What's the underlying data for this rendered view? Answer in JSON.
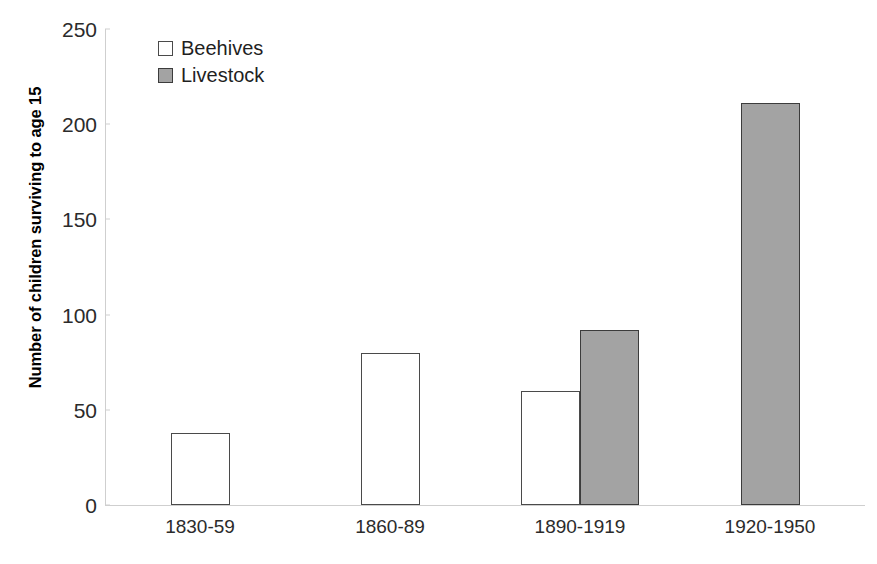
{
  "chart_data": {
    "type": "bar",
    "title": "",
    "subtitle": "",
    "xlabel": "",
    "ylabel": "Number of children surviving to age 15",
    "categories": [
      "1830-59",
      "1860-89",
      "1890-1919",
      "1920-1950"
    ],
    "series": [
      {
        "name": "Beehives",
        "color": "#ffffff",
        "values": [
          38,
          80,
          60,
          null
        ]
      },
      {
        "name": "Livestock",
        "color": "#a3a3a3",
        "values": [
          null,
          null,
          92,
          211
        ]
      }
    ],
    "ylim": [
      0,
      250
    ],
    "yticks": [
      0,
      50,
      100,
      150,
      200,
      250
    ],
    "ytick_labels": [
      "0",
      "50",
      "100",
      "150",
      "200",
      "250"
    ],
    "grid": false,
    "legend_position": "top-left",
    "legend": [
      {
        "label": "Beehives",
        "swatch": "hollow-square-icon"
      },
      {
        "label": "Livestock",
        "swatch": "filled-square-icon"
      }
    ]
  }
}
